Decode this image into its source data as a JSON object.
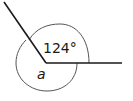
{
  "diagram": {
    "type": "angle-diagram",
    "labels": {
      "known_angle": "124°",
      "unknown_angle": "a"
    },
    "colors": {
      "stroke": "#1a1a1a",
      "arc": "#555555",
      "background": "#ffffff"
    }
  }
}
